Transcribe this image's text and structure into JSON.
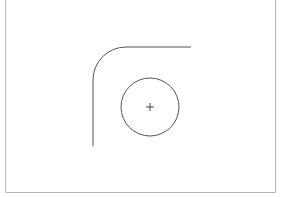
{
  "diagram": {
    "frame": {
      "left": 5.5,
      "right": 275.5,
      "bottom": 192.5,
      "color": "#b8b8b8"
    },
    "curve": {
      "start_x": 93,
      "start_y": 146,
      "corner_radius": 33,
      "top_y": 47,
      "end_x": 191,
      "color": "#555555"
    },
    "circle": {
      "cx": 150,
      "cy": 107,
      "r": 29,
      "color": "#555555"
    },
    "crosshair": {
      "cx": 150,
      "cy": 107,
      "arm": 4,
      "color": "#444444"
    }
  }
}
